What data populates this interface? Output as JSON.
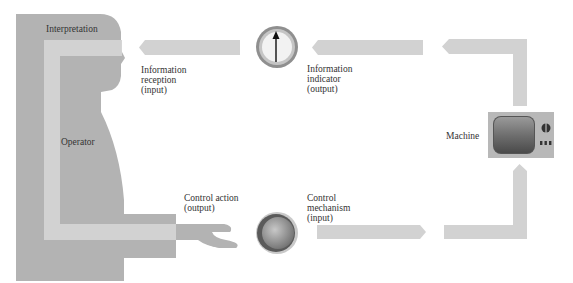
{
  "diagram": {
    "type": "human-machine-system-loop",
    "labels": {
      "interpretation": "Interpretation",
      "operator": "Operator",
      "information_reception": "Information\nreception\n(input)",
      "information_indicator": "Information\nindicator\n(output)",
      "machine": "Machine",
      "control_action": "Control action\n(output)",
      "control_mechanism": "Control\nmechanism\n(input)"
    },
    "icons": {
      "display": "dial-gauge-icon",
      "control": "knob-icon",
      "machine": "television-icon",
      "operator": "human-silhouette-icon"
    },
    "colors": {
      "silhouette": "#b3b3b3",
      "inner_path": "#d4d4d4",
      "arrow": "#d2d2d2",
      "text": "#333333"
    }
  }
}
